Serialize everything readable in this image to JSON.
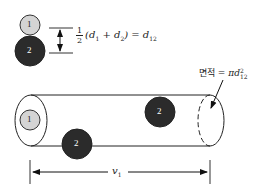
{
  "diagram": {
    "molecules": {
      "small": {
        "label": "1",
        "fill": "#d4d4d4"
      },
      "large": {
        "label": "2",
        "fill": "#2b2b2b"
      }
    },
    "formula": {
      "frac_num": "1",
      "frac_den": "2",
      "expr": "(d",
      "sub1": "1",
      "plus": " + d",
      "sub2": "2",
      "close": ") = d",
      "sub12": "12"
    },
    "area": {
      "label": "면적",
      "eq": " = πd",
      "sup": "2",
      "sub": "12"
    },
    "velocity": {
      "symbol": "v",
      "sub": "1"
    },
    "cylinder_molecules": [
      {
        "label": "1",
        "role": "moving molecule"
      },
      {
        "label": "2",
        "role": "target inside"
      },
      {
        "label": "2",
        "role": "target on boundary"
      }
    ]
  }
}
